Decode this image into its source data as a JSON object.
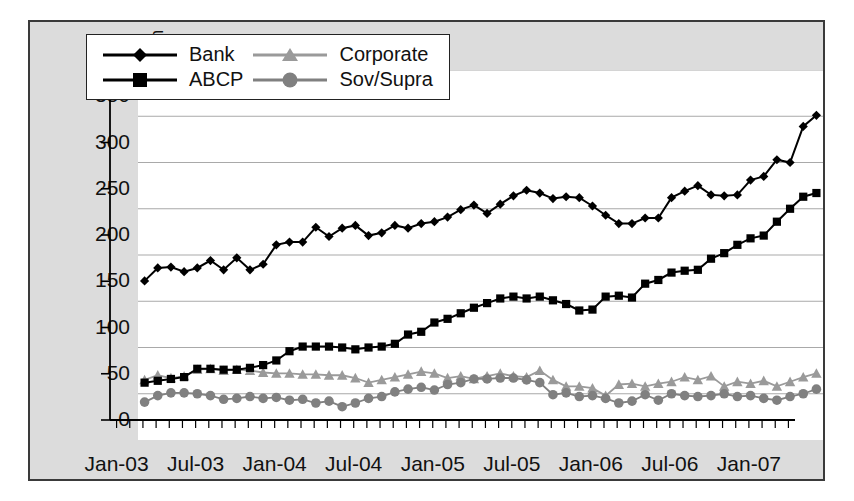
{
  "chart_data": {
    "type": "line",
    "title": "",
    "xlabel": "",
    "ylabel": "Outstandings USD million",
    "ylim": [
      0,
      400
    ],
    "yticks": [
      0,
      50,
      100,
      150,
      200,
      250,
      300,
      350,
      400
    ],
    "grid": true,
    "legend_position": "top-left",
    "x_tick_labels": [
      "Jan-03",
      "Jul-03",
      "Jan-04",
      "Jul-04",
      "Jan-05",
      "Jul-05",
      "Jan-06",
      "Jul-06",
      "Jan-07"
    ],
    "x_tick_indices": [
      0,
      6,
      12,
      18,
      24,
      30,
      36,
      42,
      48
    ],
    "x": [
      "Jan-03",
      "Feb-03",
      "Mar-03",
      "Apr-03",
      "May-03",
      "Jun-03",
      "Jul-03",
      "Aug-03",
      "Sep-03",
      "Oct-03",
      "Nov-03",
      "Dec-03",
      "Jan-04",
      "Feb-04",
      "Mar-04",
      "Apr-04",
      "May-04",
      "Jun-04",
      "Jul-04",
      "Aug-04",
      "Sep-04",
      "Oct-04",
      "Nov-04",
      "Dec-04",
      "Jan-05",
      "Feb-05",
      "Mar-05",
      "Apr-05",
      "May-05",
      "Jun-05",
      "Jul-05",
      "Aug-05",
      "Sep-05",
      "Oct-05",
      "Nov-05",
      "Dec-05",
      "Jan-06",
      "Feb-06",
      "Mar-06",
      "Apr-06",
      "May-06",
      "Jun-06",
      "Jul-06",
      "Aug-06",
      "Sep-06",
      "Oct-06",
      "Nov-06",
      "Dec-06",
      "Jan-07",
      "Feb-07",
      "Mar-07",
      "Apr-07"
    ],
    "series": [
      {
        "name": "Bank",
        "color": "#000000",
        "marker": "diamond",
        "values": [
          172,
          186,
          187,
          182,
          186,
          194,
          184,
          197,
          184,
          190,
          211,
          214,
          214,
          230,
          220,
          229,
          232,
          221,
          224,
          232,
          229,
          234,
          236,
          241,
          249,
          254,
          245,
          255,
          264,
          270,
          267,
          261,
          263,
          262,
          253,
          243,
          234,
          234,
          240,
          240,
          262,
          269,
          275,
          265,
          264,
          265,
          281,
          285,
          303,
          300,
          339,
          351
        ]
      },
      {
        "name": "ABCP",
        "color": "#000000",
        "marker": "square",
        "values": [
          62,
          64,
          66,
          68,
          77,
          77,
          76,
          76,
          78,
          81,
          86,
          96,
          101,
          101,
          101,
          100,
          98,
          100,
          101,
          104,
          114,
          117,
          127,
          131,
          137,
          143,
          148,
          153,
          155,
          153,
          155,
          151,
          147,
          140,
          141,
          155,
          156,
          154,
          169,
          173,
          181,
          183,
          184,
          196,
          202,
          211,
          218,
          221,
          236,
          250,
          263,
          267
        ]
      },
      {
        "name": "Corporate",
        "color": "#9a9a9a",
        "marker": "triangle",
        "values": [
          65,
          70,
          67,
          69,
          76,
          77,
          75,
          76,
          75,
          73,
          72,
          72,
          71,
          71,
          70,
          70,
          67,
          62,
          65,
          68,
          71,
          74,
          72,
          67,
          69,
          66,
          69,
          72,
          69,
          68,
          75,
          65,
          58,
          58,
          56,
          48,
          60,
          61,
          58,
          61,
          63,
          68,
          65,
          69,
          58,
          63,
          61,
          64,
          58,
          63,
          68,
          72
        ]
      },
      {
        "name": "Sov/Supra",
        "color": "#808080",
        "marker": "circle",
        "values": [
          41,
          48,
          51,
          51,
          50,
          48,
          44,
          45,
          47,
          45,
          46,
          43,
          44,
          40,
          42,
          36,
          40,
          45,
          47,
          52,
          55,
          57,
          54,
          60,
          62,
          66,
          66,
          67,
          67,
          65,
          62,
          49,
          51,
          47,
          48,
          45,
          40,
          42,
          49,
          43,
          50,
          48,
          47,
          48,
          50,
          47,
          48,
          45,
          43,
          47,
          50,
          55
        ]
      }
    ]
  }
}
